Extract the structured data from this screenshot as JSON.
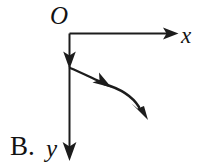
{
  "figure": {
    "name": "coordinate-axes-with-curved-arrow",
    "choice_label": "B.",
    "background_color": "#ffffff",
    "stroke_color": "#1c1c1c",
    "axes": {
      "origin_label": "O",
      "x_axis_label": "x",
      "y_axis_label": "y",
      "origin_point": [
        69,
        33
      ],
      "x_axis_end": [
        178,
        33
      ],
      "y_axis_end": [
        69,
        160
      ],
      "x_axis_direction": "right",
      "y_axis_direction": "down"
    },
    "curve": {
      "name": "trajectory-curve",
      "description": "curved arrow leaving the y-axis, bending down and to the right",
      "start_point": [
        70,
        68
      ],
      "end_point": [
        147,
        118
      ],
      "mid_arrow_point": [
        110,
        86
      ],
      "arrowheads": 2
    }
  }
}
